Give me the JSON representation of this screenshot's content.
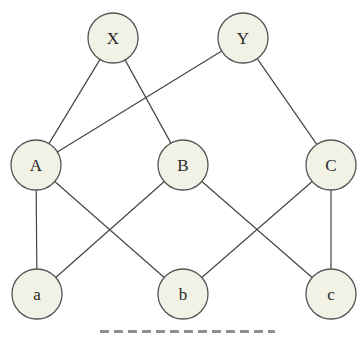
{
  "diagram": {
    "type": "layered-graph",
    "style": {
      "node_fill": "#f1f1e6",
      "node_stroke": "#555555",
      "edge_color": "#444444",
      "background": "#ffffff"
    },
    "nodes": [
      {
        "id": "X",
        "label": "X",
        "layer": 0,
        "cx": 113,
        "cy": 38,
        "r": 25
      },
      {
        "id": "Y",
        "label": "Y",
        "layer": 0,
        "cx": 243,
        "cy": 38,
        "r": 25
      },
      {
        "id": "A",
        "label": "A",
        "layer": 1,
        "cx": 36,
        "cy": 165,
        "r": 25
      },
      {
        "id": "B",
        "label": "B",
        "layer": 1,
        "cx": 183,
        "cy": 165,
        "r": 25
      },
      {
        "id": "C",
        "label": "C",
        "layer": 1,
        "cx": 331,
        "cy": 165,
        "r": 25
      },
      {
        "id": "a",
        "label": "a",
        "layer": 2,
        "cx": 37,
        "cy": 294,
        "r": 25
      },
      {
        "id": "b",
        "label": "b",
        "layer": 2,
        "cx": 183,
        "cy": 294,
        "r": 25
      },
      {
        "id": "c",
        "label": "c",
        "layer": 2,
        "cx": 331,
        "cy": 294,
        "r": 25
      }
    ],
    "edges": [
      {
        "from": "X",
        "to": "A"
      },
      {
        "from": "X",
        "to": "B"
      },
      {
        "from": "Y",
        "to": "A"
      },
      {
        "from": "Y",
        "to": "C"
      },
      {
        "from": "A",
        "to": "a"
      },
      {
        "from": "A",
        "to": "b"
      },
      {
        "from": "B",
        "to": "a"
      },
      {
        "from": "B",
        "to": "c"
      },
      {
        "from": "C",
        "to": "b"
      },
      {
        "from": "C",
        "to": "c"
      }
    ],
    "caption": {
      "text": null,
      "note": "caption clipped by bottom edge; only top of glyphs visible, not legible"
    }
  }
}
